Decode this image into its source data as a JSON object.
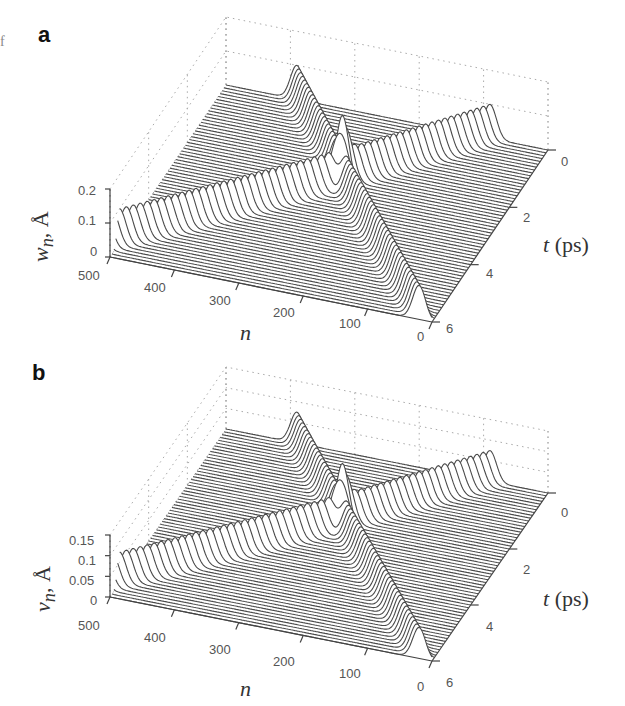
{
  "edge_fragment": "f",
  "panels": [
    {
      "letter": "a",
      "z_label": "w",
      "z_sub": "n",
      "z_unit": ", Å",
      "z_ticks": [
        "0.2",
        "0.1",
        "0"
      ],
      "n_ticks": [
        "500",
        "400",
        "300",
        "200",
        "100",
        "0"
      ],
      "n_label": "n",
      "t_ticks": [
        "0",
        "2",
        "4",
        "6"
      ],
      "t_label_var": "t",
      "t_label_unit": " (ps)"
    },
    {
      "letter": "b",
      "z_label": "v",
      "z_sub": "n",
      "z_unit": ", Å",
      "z_ticks": [
        "0.15",
        "0.1",
        "0.05",
        "0"
      ],
      "n_ticks": [
        "500",
        "400",
        "300",
        "200",
        "100",
        "0"
      ],
      "n_label": "n",
      "t_ticks": [
        "0",
        "2",
        "4",
        "6"
      ],
      "t_label_var": "t",
      "t_label_unit": " (ps)"
    }
  ],
  "chart_data": [
    {
      "type": "waterfall-3d",
      "title": "a",
      "xlabel": "n",
      "ylabel": "t (ps)",
      "zlabel": "w_n, Å",
      "xlim": [
        0,
        500
      ],
      "ylim": [
        0,
        6
      ],
      "zlim": [
        0,
        0.2
      ],
      "x_ticks": [
        0,
        100,
        200,
        300,
        400,
        500
      ],
      "y_ticks": [
        0,
        2,
        4,
        6
      ],
      "z_ticks": [
        0,
        0.1,
        0.2
      ],
      "grid": true,
      "series": [
        {
          "name": "soliton 1 (moving toward n=0)",
          "t": [
            0,
            2.3,
            6
          ],
          "n_center": [
            390,
            250,
            20
          ],
          "amplitude": 0.1
        },
        {
          "name": "soliton 2 (moving toward n=500)",
          "t": [
            0,
            2.3,
            5.5
          ],
          "n_center": [
            90,
            250,
            500
          ],
          "amplitude": 0.1
        }
      ],
      "annotations": [
        "collision peak near n≈250, t≈2.3 ps, amplitude ≈0.2"
      ]
    },
    {
      "type": "waterfall-3d",
      "title": "b",
      "xlabel": "n",
      "ylabel": "t (ps)",
      "zlabel": "v_n, Å",
      "xlim": [
        0,
        500
      ],
      "ylim": [
        0,
        6
      ],
      "zlim": [
        0,
        0.15
      ],
      "x_ticks": [
        0,
        100,
        200,
        300,
        400,
        500
      ],
      "y_ticks": [
        0,
        2,
        4,
        6
      ],
      "z_ticks": [
        0,
        0.05,
        0.1,
        0.15
      ],
      "grid": true,
      "series": [
        {
          "name": "soliton 1 (moving toward n=0)",
          "t": [
            0,
            2.3,
            6
          ],
          "n_center": [
            390,
            250,
            20
          ],
          "amplitude": 0.075
        },
        {
          "name": "soliton 2 (moving toward n=500)",
          "t": [
            0,
            2.3,
            5.5
          ],
          "n_center": [
            90,
            250,
            500
          ],
          "amplitude": 0.075
        }
      ],
      "annotations": [
        "collision peak near n≈250, t≈2.3 ps, amplitude ≈0.15"
      ]
    }
  ]
}
